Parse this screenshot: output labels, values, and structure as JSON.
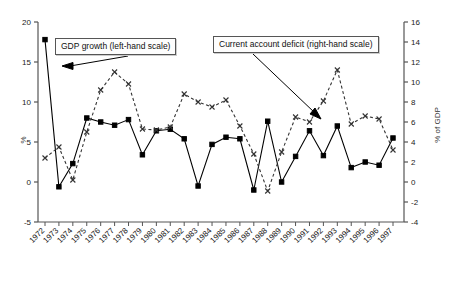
{
  "chart_data": {
    "type": "line",
    "title": "",
    "xlabel": "",
    "ylabel": "%",
    "y2label": "% of GDP",
    "grid": false,
    "legend_position": "inside-top",
    "x": [
      1972,
      1973,
      1974,
      1975,
      1976,
      1977,
      1978,
      1979,
      1980,
      1981,
      1982,
      1983,
      1984,
      1985,
      1986,
      1987,
      1988,
      1989,
      1990,
      1991,
      1992,
      1993,
      1994,
      1995,
      1996,
      1997
    ],
    "xticklabels": [
      "1972",
      "1973",
      "1974",
      "1975",
      "1976",
      "1977",
      "1978",
      "1979",
      "1980",
      "1981",
      "1982",
      "1983",
      "1984",
      "1985",
      "1986",
      "1987",
      "1988",
      "1989",
      "1990",
      "1991",
      "1992",
      "1993",
      "1994",
      "1995",
      "1996",
      "1997"
    ],
    "ylim": [
      -5,
      20
    ],
    "yticks": [
      -5,
      0,
      5,
      10,
      15,
      20
    ],
    "yticklabels": [
      "-5",
      "0",
      "5",
      "10",
      "15",
      "20"
    ],
    "y2lim": [
      -4,
      16
    ],
    "y2ticks": [
      -4,
      -2,
      0,
      2,
      4,
      6,
      8,
      10,
      12,
      14,
      16
    ],
    "y2ticklabels": [
      "-4",
      "-2",
      "0",
      "2",
      "4",
      "6",
      "8",
      "10",
      "12",
      "14",
      "16"
    ],
    "series": [
      {
        "name": "GDP growth (left-hand scale)",
        "axis": "left",
        "style": "solid",
        "marker": "square",
        "color": "#000000",
        "values": [
          17.8,
          -0.6,
          2.3,
          8.0,
          7.5,
          7.1,
          7.8,
          3.4,
          6.4,
          6.6,
          5.4,
          -0.5,
          4.7,
          5.6,
          5.4,
          -1.0,
          7.6,
          0.0,
          3.2,
          6.4,
          3.3,
          7.0,
          1.8,
          2.5,
          2.1,
          5.5
        ]
      },
      {
        "name": "Current account deficit (right-hand scale)",
        "axis": "right",
        "style": "dashed",
        "marker": "x",
        "color": "#333333",
        "values": [
          2.4,
          3.5,
          0.2,
          5.0,
          9.2,
          11.0,
          9.8,
          5.3,
          5.2,
          5.5,
          8.8,
          8.0,
          7.5,
          8.2,
          5.6,
          2.8,
          -0.9,
          3.0,
          6.5,
          6.0,
          8.1,
          11.2,
          5.8,
          6.6,
          6.3,
          3.2
        ]
      }
    ],
    "annotations": [
      {
        "label": "GDP growth (left-hand scale)",
        "arrow_to_series": "GDP growth (left-hand scale)"
      },
      {
        "label": "Current account deficit (right-hand scale)",
        "arrow_to_series": "Current account deficit (right-hand scale)"
      }
    ]
  },
  "legend": {
    "gdp_label": "GDP growth (left-hand scale)",
    "cad_label": "Current account deficit (right-hand scale)"
  },
  "axes": {
    "left_title": "%",
    "right_title": "% of GDP"
  }
}
